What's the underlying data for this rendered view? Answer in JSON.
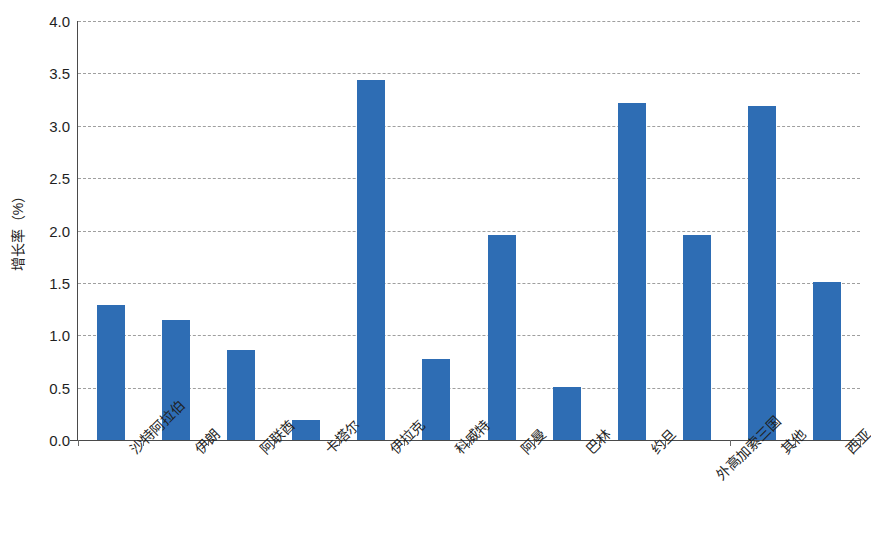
{
  "chart_data": {
    "type": "bar",
    "title": "",
    "subtitle": "",
    "xlabel": "",
    "ylabel": "增长率（%）",
    "ylim": [
      0,
      4.0
    ],
    "ytick_step": 0.5,
    "yticks": [
      "0.0",
      "0.5",
      "1.0",
      "1.5",
      "2.0",
      "2.5",
      "3.0",
      "3.5",
      "4.0"
    ],
    "ytick_values": [
      0.0,
      0.5,
      1.0,
      1.5,
      2.0,
      2.5,
      3.0,
      3.5,
      4.0
    ],
    "grid": true,
    "grid_style": "dashed-horizontal",
    "legend": "none",
    "bar_color": "#2e6db4",
    "categories": [
      "沙特阿拉伯",
      "伊朗",
      "阿联酋",
      "卡塔尔",
      "伊拉克",
      "科威特",
      "阿曼",
      "巴林",
      "约旦",
      "外高加索三国",
      "其他",
      "西亚"
    ],
    "values": [
      1.29,
      1.15,
      0.86,
      0.19,
      3.44,
      0.77,
      1.96,
      0.51,
      3.22,
      1.96,
      3.19,
      1.51
    ],
    "series": [
      {
        "name": "增长率",
        "values": [
          1.29,
          1.15,
          0.86,
          0.19,
          3.44,
          0.77,
          1.96,
          0.51,
          3.22,
          1.96,
          3.19,
          1.51
        ]
      }
    ]
  }
}
